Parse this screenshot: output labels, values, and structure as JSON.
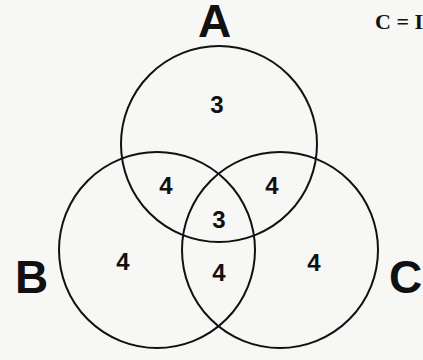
{
  "caption": "C = I",
  "sets": {
    "A": {
      "label": "A"
    },
    "B": {
      "label": "B"
    },
    "C": {
      "label": "C"
    }
  },
  "regions": {
    "a_only": "3",
    "a_b": "4",
    "a_c": "4",
    "a_b_c": "3",
    "b_only": "4",
    "b_c": "4",
    "c_only": "4"
  },
  "colors": {
    "stroke": "#111111",
    "background": "#f7f7f5"
  }
}
